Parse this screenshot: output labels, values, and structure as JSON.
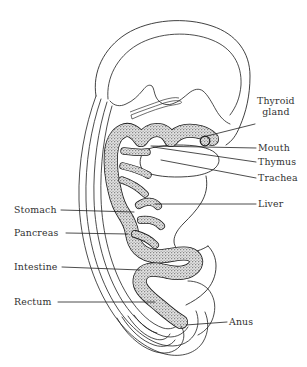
{
  "figure": {
    "background_color": "#ffffff",
    "ink_color": "#1f1f1f",
    "label_color": "#313131",
    "gut_fill_color": "#c9c9c9",
    "gut_stipple_color": "#6e6e6e"
  },
  "labels": {
    "thyroid_gland_line1": "Thyroid",
    "thyroid_gland_line2": "gland",
    "mouth": "Mouth",
    "thymus": "Thymus",
    "trachea": "Trachea",
    "liver": "Liver",
    "anus": "Anus",
    "stomach": "Stomach",
    "pancreas": "Pancreas",
    "intestine": "Intestine",
    "rectum": "Rectum"
  },
  "annotations": [
    {
      "name": "thyroid-gland",
      "text": "Thyroid gland",
      "side": "right",
      "label_x": 257,
      "label_y": 101,
      "leader_from": [
        255,
        124
      ],
      "leader_to": [
        203,
        137
      ]
    },
    {
      "name": "mouth",
      "text": "Mouth",
      "side": "right",
      "label_x": 258,
      "label_y": 143,
      "leader_from": [
        256,
        148
      ],
      "leader_to": [
        151,
        146
      ]
    },
    {
      "name": "thymus",
      "text": "Thymus",
      "side": "right",
      "label_x": 258,
      "label_y": 158,
      "leader_from": [
        256,
        162
      ],
      "leader_to": [
        151,
        147
      ]
    },
    {
      "name": "trachea",
      "text": "Trachea",
      "side": "right",
      "label_x": 258,
      "label_y": 174,
      "leader_from": [
        256,
        178
      ],
      "leader_to": [
        160,
        160
      ]
    },
    {
      "name": "liver",
      "text": "Liver",
      "side": "right",
      "label_x": 258,
      "label_y": 200,
      "leader_from": [
        256,
        204
      ],
      "leader_to": [
        155,
        204
      ]
    },
    {
      "name": "anus",
      "text": "Anus",
      "side": "right",
      "label_x": 229,
      "label_y": 317,
      "leader_from": [
        227,
        322
      ],
      "leader_to": [
        186,
        325
      ]
    },
    {
      "name": "stomach",
      "text": "Stomach",
      "side": "left",
      "label_x": 14,
      "label_y": 205,
      "leader_from": [
        61,
        210
      ],
      "leader_to": [
        134,
        212
      ]
    },
    {
      "name": "pancreas",
      "text": "Pancreas",
      "side": "left",
      "label_x": 14,
      "label_y": 228,
      "leader_from": [
        66,
        233
      ],
      "leader_to": [
        128,
        234
      ]
    },
    {
      "name": "intestine",
      "text": "Intestine",
      "side": "left",
      "label_x": 14,
      "label_y": 262,
      "leader_from": [
        62,
        267
      ],
      "leader_to": [
        140,
        270
      ]
    },
    {
      "name": "rectum",
      "text": "Rectum",
      "side": "left",
      "label_x": 14,
      "label_y": 297,
      "leader_from": [
        58,
        302
      ],
      "leader_to": [
        155,
        302
      ]
    }
  ],
  "structures": [
    {
      "name": "body-outline",
      "description": "outer contour of curved embryo"
    },
    {
      "name": "body-wall-layers",
      "description": "nested ventral body-wall curves"
    },
    {
      "name": "brain-outline",
      "description": "cranial / brain vesicle contour"
    },
    {
      "name": "gut-tube",
      "description": "stippled digestive tract from mouth to anus"
    },
    {
      "name": "heart-outline",
      "description": "white pericardial / heart region"
    },
    {
      "name": "liver-outline",
      "description": "liver bulge contour"
    },
    {
      "name": "tail-outline",
      "description": "caudal tail fold"
    }
  ]
}
